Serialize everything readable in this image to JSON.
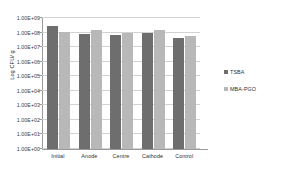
{
  "chart_data": {
    "type": "bar",
    "title": "",
    "subtitle": "",
    "xlabel": "",
    "ylabel": "Log CFU/ g",
    "categories": [
      "Initial",
      "Anode",
      "Centre",
      "Cathode",
      "Control"
    ],
    "series": [
      {
        "name": "TSBA",
        "color": "#6e6e6e",
        "values": [
          280000000,
          85000000,
          65000000,
          100000000,
          45000000
        ]
      },
      {
        "name": "MBA-PGO",
        "color": "#b8b8b8",
        "values": [
          105000000,
          140000000,
          90000000,
          150000000,
          60000000
        ]
      }
    ],
    "yscale": "log",
    "ylim": [
      1,
      1000000000
    ],
    "y_tick_labels": [
      "1.00E+09",
      "1.00E+08",
      "1.00E+07",
      "1.00E+06",
      "1.00E+05",
      "1.00E+04",
      "1.00E+03",
      "1.00E+02",
      "1.00E+01",
      "1.00E+00"
    ],
    "y_tick_values": [
      1000000000,
      100000000,
      10000000,
      1000000,
      100000,
      10000,
      1000,
      100,
      10,
      1
    ],
    "grid": true,
    "legend_position": "right",
    "background_color": "#ffffff",
    "gridline_color": "#d2d2d2",
    "axis_color": "#9a9a9a"
  }
}
